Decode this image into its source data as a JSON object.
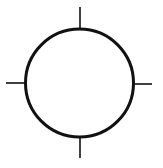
{
  "figure": {
    "type": "circle-with-ticks",
    "colors": {
      "background": "#ffffff",
      "stroke": "#111111"
    },
    "circle": {
      "cx": 79.5,
      "cy": 83,
      "r": 54,
      "stroke_width": 3
    },
    "ticks": [
      {
        "name": "top",
        "x1": 80,
        "y1": 7,
        "x2": 80,
        "y2": 29
      },
      {
        "name": "right",
        "x1": 133,
        "y1": 84,
        "x2": 152,
        "y2": 84
      },
      {
        "name": "bottom",
        "x1": 80,
        "y1": 137,
        "x2": 80,
        "y2": 158
      },
      {
        "name": "left",
        "x1": 6,
        "y1": 83,
        "x2": 26,
        "y2": 83
      }
    ],
    "tick_stroke_width": 1.6
  }
}
